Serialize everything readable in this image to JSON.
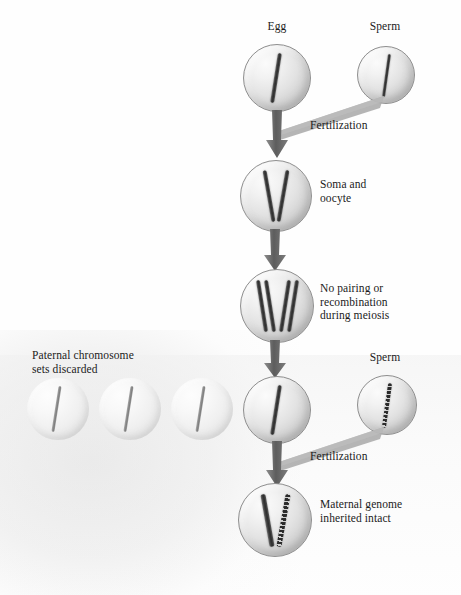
{
  "diagram": {
    "background_color": "#fefefe",
    "chromosome_colors": {
      "maternal_solid": "#2e2e2e",
      "paternal_beaded": "#2b2b2b",
      "discarded_faint": "#8b8b8b"
    },
    "cell_fill": "#e3e3e3",
    "arrow_color": "#6b6b6b"
  },
  "labels": {
    "egg": "Egg",
    "sperm_top": "Sperm",
    "sperm_bottom": "Sperm",
    "fertilization_top": "Fertilization",
    "fertilization_bottom": "Fertilization",
    "soma_and_oocyte": "Soma and\noocyte",
    "no_pairing": "No pairing or\nrecombination\nduring meiosis",
    "paternal_discarded": "Paternal chromosome\nsets discarded",
    "maternal_intact": "Maternal genome\ninherited intact"
  },
  "stages": [
    {
      "name": "egg-cell",
      "label": "Egg",
      "chromosomes": 1,
      "chromosome_type": "solid"
    },
    {
      "name": "sperm-cell-top",
      "label": "Sperm",
      "chromosomes": 1,
      "chromosome_type": "solid"
    },
    {
      "name": "soma-oocyte-cell",
      "label": "Soma and oocyte",
      "chromosomes": 2,
      "chromosome_type": "solid"
    },
    {
      "name": "meiosis-cell",
      "label": "No pairing or recombination during meiosis",
      "chromosomes": 4,
      "chromosome_type": "solid"
    },
    {
      "name": "discarded-cell-1",
      "label": "Paternal chromosome sets discarded",
      "chromosomes": 1,
      "chromosome_type": "faint"
    },
    {
      "name": "discarded-cell-2",
      "label": "Paternal chromosome sets discarded",
      "chromosomes": 1,
      "chromosome_type": "faint"
    },
    {
      "name": "discarded-cell-3",
      "label": "Paternal chromosome sets discarded",
      "chromosomes": 1,
      "chromosome_type": "faint"
    },
    {
      "name": "maternal-egg-cell",
      "label": "",
      "chromosomes": 1,
      "chromosome_type": "solid"
    },
    {
      "name": "sperm-cell-bottom",
      "label": "Sperm",
      "chromosomes": 1,
      "chromosome_type": "beaded"
    },
    {
      "name": "zygote-cell",
      "label": "Maternal genome inherited intact",
      "chromosomes": 2,
      "chromosome_type": "solid+beaded"
    }
  ]
}
